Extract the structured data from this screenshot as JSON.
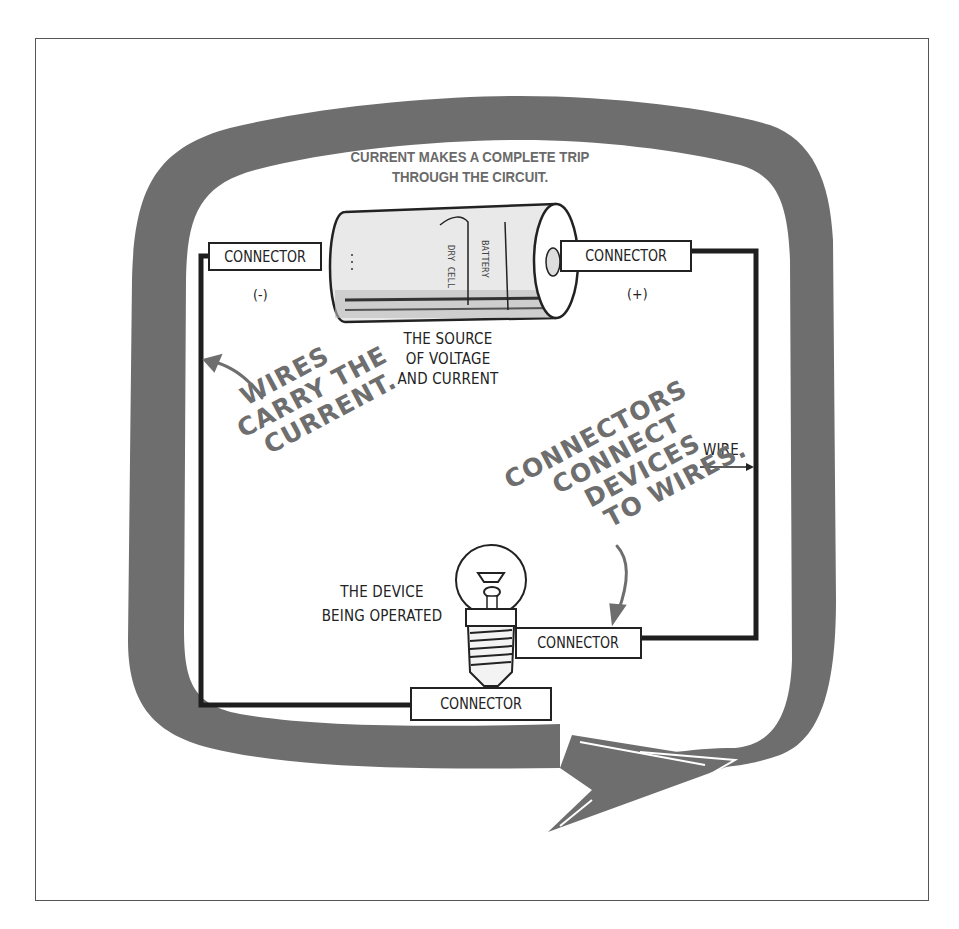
{
  "title": {
    "line1": "CURRENT MAKES A COMPLETE TRIP",
    "line2": "THROUGH THE CIRCUIT."
  },
  "battery": {
    "label_line1": "THE SOURCE",
    "label_line2": "OF VOLTAGE",
    "label_line3": "AND CURRENT"
  },
  "connectors": {
    "negative": {
      "label": "CONNECTOR",
      "polarity": "(-)"
    },
    "positive": {
      "label": "CONNECTOR",
      "polarity": "(+)"
    },
    "lamp_side": {
      "label": "CONNECTOR"
    },
    "lamp_base": {
      "label": "CONNECTOR"
    }
  },
  "device": {
    "label_line1": "THE DEVICE",
    "label_line2": "BEING OPERATED"
  },
  "wire_label": "WIRE",
  "annotations": {
    "wires": [
      "WIRES",
      "CARRY THE",
      "CURRENT."
    ],
    "connectors": [
      "CONNECTORS",
      "CONNECT",
      "DEVICES",
      "TO WIRES."
    ]
  },
  "colors": {
    "arrow_loop": "#6e6e6e",
    "wire": "#1e1e1e",
    "text": "#222222",
    "handwriting": "#6e6e6e",
    "background": "#ffffff"
  }
}
